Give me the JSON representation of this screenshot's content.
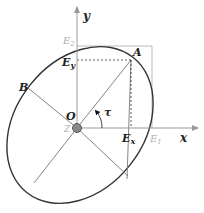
{
  "diagram": {
    "type": "polarization-ellipse",
    "axes": {
      "x_label": "x",
      "y_label": "y",
      "origin_label": "O",
      "z_label": "Z"
    },
    "points": {
      "A": "A",
      "B": "B"
    },
    "components": {
      "Ex": "E",
      "Ex_sub": "x",
      "Ey": "E",
      "Ey_sub": "y",
      "E1": "E",
      "E1_sub": "1",
      "E2": "E",
      "E2_sub": "2"
    },
    "angle_label": "τ",
    "colors": {
      "curve": "#333333",
      "axis": "#888888",
      "guide": "#aaaaaa",
      "label": "#222222",
      "label_muted": "#b0b0b0"
    }
  }
}
